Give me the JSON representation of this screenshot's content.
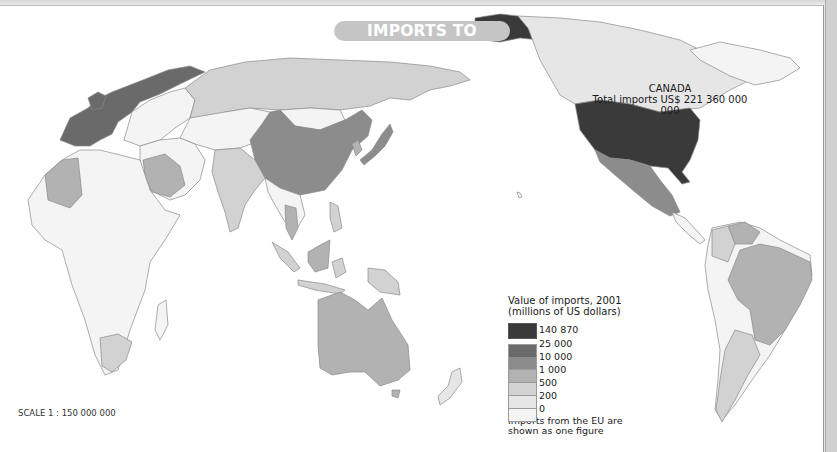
{
  "title": "IMPORTS TO CANADA",
  "annotation": {
    "country": "CANADA",
    "total": "Total imports US$ 221 360 000 000"
  },
  "legend": {
    "title_line1": "Value of imports, 2001",
    "title_line2": "(millions of US dollars)",
    "classes": [
      {
        "label": "140 870",
        "color": "#3a3a3a"
      },
      {
        "label": "25 000",
        "color": "#6a6a6a"
      },
      {
        "label": "10 000",
        "color": "#8c8c8c"
      },
      {
        "label": "1 000",
        "color": "#b2b2b2"
      },
      {
        "label": "500",
        "color": "#d2d2d2"
      },
      {
        "label": "200",
        "color": "#e6e6e6"
      },
      {
        "label": "0",
        "color": "#f4f4f4"
      }
    ],
    "note_line1": "Imports from the EU are",
    "note_line2": "shown as one figure"
  },
  "scale": "SCALE 1 : 150 000 000",
  "colors": {
    "title_pill": "#c5c5c5",
    "border": "#d0d0d0",
    "outline": "#8a8a8a"
  },
  "map_regions": [
    {
      "name": "United States",
      "class": "140 870"
    },
    {
      "name": "European Union",
      "class": "25 000"
    },
    {
      "name": "China",
      "class": "10 000"
    },
    {
      "name": "Japan",
      "class": "10 000"
    },
    {
      "name": "Mexico",
      "class": "10 000"
    },
    {
      "name": "Australia",
      "class": "1 000"
    },
    {
      "name": "Brazil",
      "class": "1 000"
    },
    {
      "name": "South Korea",
      "class": "1 000"
    },
    {
      "name": "Thailand",
      "class": "1 000"
    },
    {
      "name": "Malaysia",
      "class": "1 000"
    },
    {
      "name": "Algeria",
      "class": "1 000"
    },
    {
      "name": "Saudi Arabia",
      "class": "1 000"
    },
    {
      "name": "Venezuela",
      "class": "1 000"
    },
    {
      "name": "India",
      "class": "500"
    },
    {
      "name": "Russia",
      "class": "500"
    },
    {
      "name": "Indonesia",
      "class": "500"
    },
    {
      "name": "South Africa",
      "class": "500"
    },
    {
      "name": "Argentina",
      "class": "500"
    },
    {
      "name": "Colombia",
      "class": "500"
    },
    {
      "name": "New Zealand",
      "class": "200"
    },
    {
      "name": "Canada",
      "class": "reference"
    }
  ]
}
